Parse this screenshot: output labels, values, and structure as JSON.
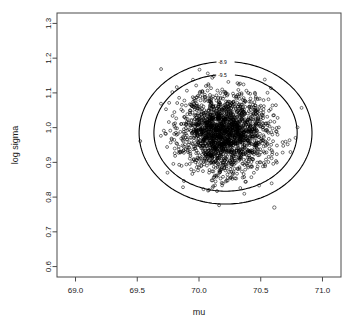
{
  "chart_data": {
    "type": "scatter",
    "title": "",
    "xlabel": "mu",
    "ylabel": "log sigma",
    "xlim": [
      68.85,
      71.15
    ],
    "ylim": [
      0.57,
      1.33
    ],
    "xticks": [
      "69.0",
      "69.5",
      "70.0",
      "70.5",
      "71.0"
    ],
    "xtick_values": [
      69.0,
      69.5,
      70.0,
      70.5,
      71.0
    ],
    "yticks": [
      "0.6",
      "0.7",
      "0.8",
      "0.9",
      "1.0",
      "1.1",
      "1.2",
      "1.3"
    ],
    "ytick_values": [
      0.6,
      0.7,
      0.8,
      0.9,
      1.0,
      1.1,
      1.2,
      1.3
    ],
    "grid": false,
    "legend": "none",
    "point_marker": "open-circle",
    "point_count": 2000,
    "cloud": {
      "center_x": 70.21,
      "center_y": 0.985,
      "sd_x": 0.175,
      "sd_y": 0.058,
      "correlation": 0.0
    },
    "outliers": [
      {
        "x": 70.61,
        "y": 0.77
      }
    ],
    "contours": [
      {
        "label": "-8.9",
        "level": -8.9,
        "center_x": 70.215,
        "center_y": 0.985,
        "radius_x": 0.7,
        "radius_y": 0.205,
        "label_x": 70.19,
        "label_y": 1.188
      },
      {
        "label": "-9.5",
        "level": -9.5,
        "center_x": 70.215,
        "center_y": 0.985,
        "radius_x": 0.58,
        "radius_y": 0.168,
        "label_x": 70.19,
        "label_y": 1.152
      }
    ]
  },
  "colors": {
    "background": "#ffffff",
    "frame": "#4a4a4a",
    "point": "#000000",
    "contour": "#000000",
    "text": "#1a1a1a"
  }
}
